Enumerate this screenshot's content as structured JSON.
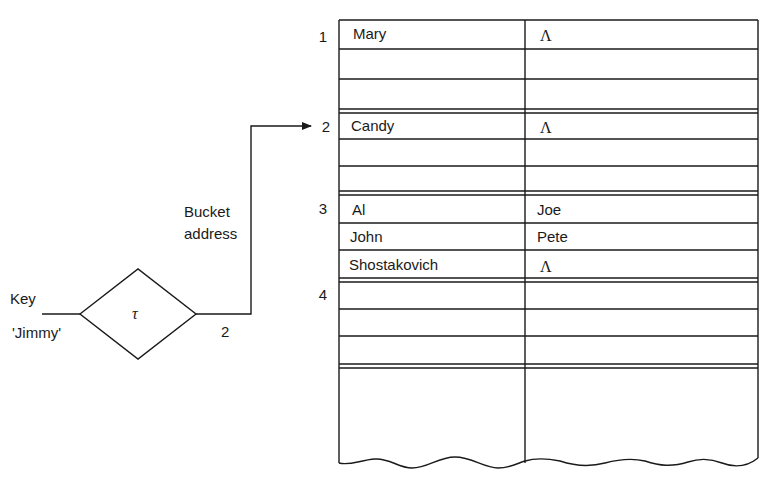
{
  "diagram": {
    "input": {
      "label": "Key",
      "value": "'Jimmy'"
    },
    "hash_function": {
      "symbol": "τ"
    },
    "output": {
      "value": "2",
      "label_line1": "Bucket",
      "label_line2": "address"
    },
    "buckets": [
      {
        "number": "1",
        "slots": [
          {
            "key": "Mary",
            "link": "Λ"
          },
          {
            "key": "",
            "link": ""
          },
          {
            "key": "",
            "link": ""
          }
        ]
      },
      {
        "number": "2",
        "slots": [
          {
            "key": "Candy",
            "link": "Λ"
          },
          {
            "key": "",
            "link": ""
          },
          {
            "key": "",
            "link": ""
          }
        ]
      },
      {
        "number": "3",
        "slots": [
          {
            "key": "Al",
            "link": "Joe"
          },
          {
            "key": "John",
            "link": "Pete"
          },
          {
            "key": "Shostakovich",
            "link": "Λ"
          }
        ]
      },
      {
        "number": "4",
        "slots": [
          {
            "key": "",
            "link": ""
          },
          {
            "key": "",
            "link": ""
          },
          {
            "key": "",
            "link": ""
          }
        ]
      }
    ],
    "colors": {
      "ink": "#1a1a1a",
      "background": "#ffffff"
    }
  }
}
